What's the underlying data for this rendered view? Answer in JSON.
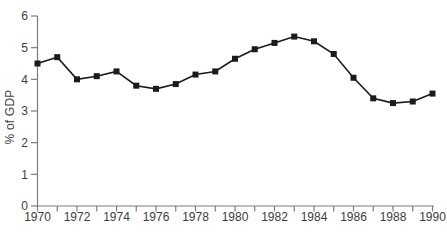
{
  "figure": {
    "background": "#ffffff"
  },
  "chart_data": {
    "type": "line",
    "title": "",
    "xlabel": "",
    "ylabel": "% of GDP",
    "x": [
      1970,
      1971,
      1972,
      1973,
      1974,
      1975,
      1976,
      1977,
      1978,
      1979,
      1980,
      1981,
      1982,
      1983,
      1984,
      1985,
      1986,
      1987,
      1988,
      1989,
      1990
    ],
    "values": [
      4.5,
      4.7,
      4.0,
      4.1,
      4.25,
      3.8,
      3.7,
      3.85,
      4.15,
      4.25,
      4.65,
      4.95,
      5.15,
      5.35,
      5.2,
      4.8,
      4.05,
      3.4,
      3.25,
      3.3,
      3.55
    ],
    "ylim": [
      0,
      6
    ],
    "yticks": [
      0,
      1,
      2,
      3,
      4,
      5,
      6
    ],
    "xtick_labels": [
      1970,
      1972,
      1974,
      1976,
      1978,
      1980,
      1982,
      1984,
      1986,
      1988,
      1990
    ],
    "xticks_every_year": true,
    "grid": false,
    "legend": "none",
    "marker": "filled-square",
    "colors": {
      "line": "#1b1b1b",
      "marker": "#1b1b1b",
      "axis": "#7d7d7d",
      "tick_label": "#3c3c3c",
      "background": "#ffffff"
    }
  }
}
